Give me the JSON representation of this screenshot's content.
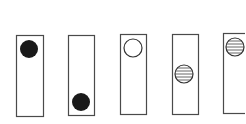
{
  "diagram": {
    "stroke_color": "#4a4a4a",
    "fill_dark": "#1a1a1a",
    "background": "#ffffff",
    "panels": [
      {
        "x": 16,
        "y": 35,
        "w": 27,
        "h": 81,
        "ball": {
          "cx": 29,
          "cy": 49,
          "r": 9,
          "style": "solid-black"
        }
      },
      {
        "x": 68,
        "y": 35,
        "w": 26,
        "h": 80,
        "ball": {
          "cx": 81,
          "cy": 102,
          "r": 9,
          "style": "solid-black"
        }
      },
      {
        "x": 120,
        "y": 34,
        "w": 26,
        "h": 80,
        "ball": {
          "cx": 133,
          "cy": 48,
          "r": 9,
          "style": "hollow"
        }
      },
      {
        "x": 172,
        "y": 34,
        "w": 26,
        "h": 80,
        "ball": {
          "cx": 184,
          "cy": 74,
          "r": 9,
          "style": "striped"
        }
      },
      {
        "x": 223,
        "y": 33,
        "w": 26,
        "h": 80,
        "ball": {
          "cx": 235,
          "cy": 47,
          "r": 9,
          "style": "striped"
        }
      }
    ]
  }
}
